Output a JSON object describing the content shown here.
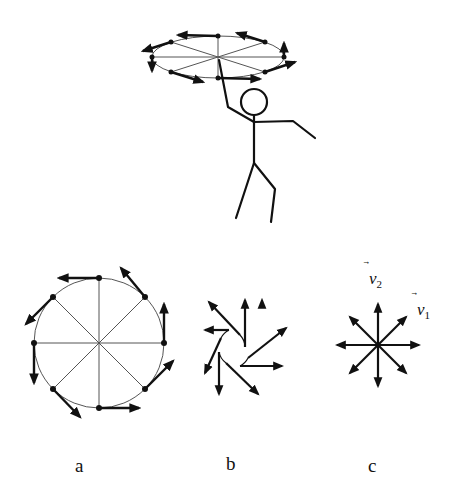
{
  "figure": {
    "colors": {
      "stroke": "#111111",
      "thin_line": "#555555",
      "background": "#ffffff"
    }
  },
  "panels": {
    "a": {
      "label": "a"
    },
    "b": {
      "label": "b"
    },
    "c": {
      "label": "c",
      "vectors": [
        {
          "symbol": "v",
          "subscript": "2"
        },
        {
          "symbol": "v",
          "subscript": "1"
        }
      ]
    }
  },
  "top_scene": {
    "subject": "stick figure spinning disc",
    "arrow_count": 8
  }
}
